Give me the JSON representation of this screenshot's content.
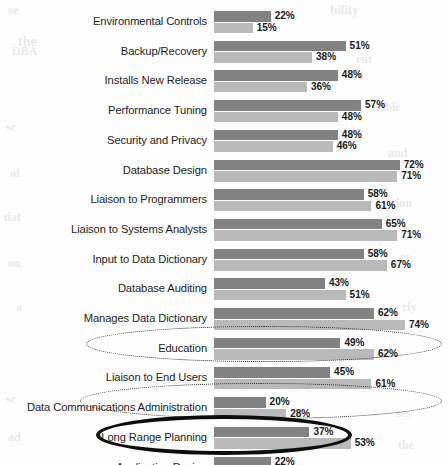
{
  "chart_data": {
    "type": "bar",
    "orientation": "horizontal",
    "title": "",
    "subtitle": "",
    "xlabel": "",
    "ylabel": "",
    "xlim": [
      0,
      80
    ],
    "grid": false,
    "legend_position": "none",
    "value_suffix": "%",
    "colors": {
      "primary_bar": "#828282",
      "secondary_bar": "#b9b9b9",
      "text": "#1a1a1a",
      "callout_dashed": "#2b2b2b",
      "callout_solid": "#0d0d0d"
    },
    "categories": [
      "Environmental Controls",
      "Backup/Recovery",
      "Installs New Release",
      "Performance Tuning",
      "Security and Privacy",
      "Database Design",
      "Liaison to Programmers",
      "Liaison to Systems Analysts",
      "Input to Data Dictionary",
      "Database Auditing",
      "Manages Data Dictionary",
      "Education",
      "Liaison to End Users",
      "Data Communications Administration",
      "Long Range Planning",
      "Application Design"
    ],
    "series": [
      {
        "name": "primary",
        "values": [
          22,
          51,
          48,
          57,
          48,
          72,
          58,
          65,
          58,
          43,
          62,
          49,
          45,
          20,
          37,
          22
        ]
      },
      {
        "name": "secondary",
        "values": [
          15,
          38,
          36,
          48,
          46,
          71,
          61,
          71,
          67,
          51,
          74,
          62,
          61,
          28,
          53,
          38
        ]
      }
    ],
    "value_labels": {
      "primary": [
        "22%",
        "51%",
        "48%",
        "57%",
        "48%",
        "72%",
        "58%",
        "65%",
        "58%",
        "43%",
        "62%",
        "49%",
        "45%",
        "20%",
        "37%",
        "22%"
      ],
      "secondary": [
        "15%",
        "38%",
        "36%",
        "48%",
        "46%",
        "71%",
        "61%",
        "71%",
        "67%",
        "51%",
        "74%",
        "62%",
        "61%",
        "28%",
        "53%",
        "38%"
      ]
    },
    "annotations": [
      {
        "name": "liaison-to-end-users-highlight",
        "target": "Liaison to End Users",
        "style": "dashed-oval"
      },
      {
        "name": "long-range-planning-highlight",
        "target": "Long Range Planning",
        "style": "dashed-oval"
      },
      {
        "name": "application-design-highlight",
        "target": "Application Design",
        "style": "solid-oval"
      }
    ]
  },
  "background_bleed": [
    {
      "text": "se",
      "x": 8,
      "y": 2,
      "size": 13
    },
    {
      "text": "the",
      "x": 18,
      "y": 34,
      "size": 14
    },
    {
      "text": "DBA",
      "x": 12,
      "y": 44,
      "size": 12
    },
    {
      "text": "sc",
      "x": 6,
      "y": 120,
      "size": 12
    },
    {
      "text": "of",
      "x": 10,
      "y": 166,
      "size": 12
    },
    {
      "text": "dat",
      "x": 4,
      "y": 210,
      "size": 12
    },
    {
      "text": "on",
      "x": 8,
      "y": 256,
      "size": 12
    },
    {
      "text": "a",
      "x": 16,
      "y": 300,
      "size": 12
    },
    {
      "text": "sc",
      "x": 6,
      "y": 392,
      "size": 12
    },
    {
      "text": "ad",
      "x": 8,
      "y": 430,
      "size": 12
    },
    {
      "text": "bility",
      "x": 330,
      "y": 2,
      "size": 13
    },
    {
      "text": "ent",
      "x": 356,
      "y": 52,
      "size": 12
    },
    {
      "text": "rsible",
      "x": 372,
      "y": 100,
      "size": 12
    },
    {
      "text": "and",
      "x": 388,
      "y": 146,
      "size": 12
    },
    {
      "text": "tion",
      "x": 392,
      "y": 196,
      "size": 12
    },
    {
      "text": "es",
      "x": 400,
      "y": 250,
      "size": 12
    },
    {
      "text": "rly",
      "x": 402,
      "y": 300,
      "size": 12
    },
    {
      "text": "ses",
      "x": 396,
      "y": 406,
      "size": 12
    },
    {
      "text": "the",
      "x": 398,
      "y": 438,
      "size": 12
    }
  ]
}
